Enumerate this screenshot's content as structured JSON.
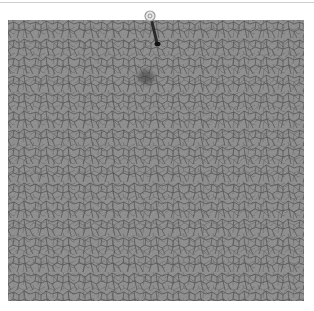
{
  "image": {
    "subject": "cracked dry mud surface",
    "marker": "pin",
    "colors": {
      "surface": "#8a8a8a",
      "crack": "#3a3a3a",
      "highlight": "#a8a8a8",
      "background": "#ffffff"
    }
  }
}
